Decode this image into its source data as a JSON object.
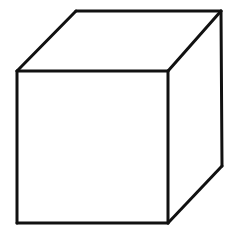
{
  "figure": {
    "background_color": "#ffffff",
    "stroke_color": "#111111",
    "fill_color": "#ffffff",
    "stroke_width": 3,
    "canvas": {
      "width": 237,
      "height": 239
    },
    "vertices": {
      "front_top_left": {
        "x": 17,
        "y": 71
      },
      "front_top_right": {
        "x": 168,
        "y": 71
      },
      "front_bottom_right": {
        "x": 168,
        "y": 223
      },
      "front_bottom_left": {
        "x": 17,
        "y": 223
      },
      "back_top_left": {
        "x": 76,
        "y": 11
      },
      "back_top_right": {
        "x": 221,
        "y": 11
      },
      "back_bottom_right": {
        "x": 222,
        "y": 166
      }
    },
    "faces": [
      {
        "name": "front-face",
        "points": "17,71 168,71 168,223 17,223"
      },
      {
        "name": "top-face",
        "points": "17,71 76,11 221,11 168,71"
      },
      {
        "name": "right-face",
        "points": "168,71 221,11 222,166 168,223"
      }
    ],
    "edges": [
      {
        "name": "front-top-edge",
        "x1": 17,
        "y1": 71,
        "x2": 168,
        "y2": 71
      },
      {
        "name": "front-right-edge",
        "x1": 168,
        "y1": 71,
        "x2": 168,
        "y2": 223
      },
      {
        "name": "front-bottom-edge",
        "x1": 168,
        "y1": 223,
        "x2": 17,
        "y2": 223
      },
      {
        "name": "front-left-edge",
        "x1": 17,
        "y1": 223,
        "x2": 17,
        "y2": 71
      },
      {
        "name": "top-left-receding-edge",
        "x1": 17,
        "y1": 71,
        "x2": 76,
        "y2": 11
      },
      {
        "name": "back-top-edge",
        "x1": 76,
        "y1": 11,
        "x2": 221,
        "y2": 11
      },
      {
        "name": "top-right-receding-edge",
        "x1": 221,
        "y1": 11,
        "x2": 168,
        "y2": 71
      },
      {
        "name": "back-right-edge",
        "x1": 221,
        "y1": 11,
        "x2": 222,
        "y2": 166
      },
      {
        "name": "bottom-right-receding-edge",
        "x1": 222,
        "y1": 166,
        "x2": 168,
        "y2": 223
      }
    ]
  }
}
